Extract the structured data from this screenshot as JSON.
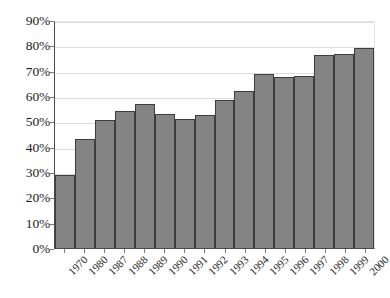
{
  "chart_data": {
    "type": "bar",
    "title": "",
    "xlabel": "",
    "ylabel": "",
    "ylim": [
      0,
      90
    ],
    "grid": true,
    "legend": "none",
    "orientation": "vertical",
    "bar_color": "#848484",
    "bar_edge_color": "#3d3d3d",
    "gridline_color": "#dcdcdc",
    "axis_color": "#4a4a4a",
    "categories": [
      "1970",
      "1980",
      "1987",
      "1988",
      "1989",
      "1990",
      "1991",
      "1992",
      "1993",
      "1994",
      "1995",
      "1996",
      "1997",
      "1998",
      "1999",
      "2000"
    ],
    "x": [
      "1970",
      "1980",
      "1987",
      "1988",
      "1989",
      "1990",
      "1991",
      "1992",
      "1993",
      "1994",
      "1995",
      "1996",
      "1997",
      "1998",
      "1999",
      "2000"
    ],
    "values": [
      29,
      43,
      50.5,
      54,
      57,
      53,
      51,
      52.5,
      58.5,
      62,
      68.5,
      67.5,
      68,
      76,
      76.5,
      79
    ],
    "value_labels": [
      "29%",
      "43%",
      "50.5%",
      "54%",
      "57%",
      "53%",
      "51%",
      "52.5%",
      "58.5%",
      "62%",
      "68.5%",
      "67.5%",
      "68%",
      "76%",
      "76.5%",
      "79%"
    ],
    "ytick_values": [
      0,
      10,
      20,
      30,
      40,
      50,
      60,
      70,
      80,
      90
    ],
    "ytick_labels": [
      "0%",
      "10%",
      "20%",
      "30%",
      "40%",
      "50%",
      "60%",
      "70%",
      "80%",
      "90%"
    ]
  }
}
